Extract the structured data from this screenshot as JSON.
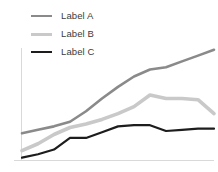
{
  "chart_data": {
    "type": "line",
    "title": "",
    "subtitle": "",
    "xlabel": "",
    "ylabel": "",
    "grid": false,
    "legend_position": "top-left",
    "xlim": [
      0,
      12
    ],
    "ylim": [
      0,
      100
    ],
    "x": [
      0,
      1,
      2,
      3,
      4,
      5,
      6,
      7,
      8,
      9,
      10,
      11,
      12
    ],
    "series": [
      {
        "name": "Label A",
        "color": "#8a8a8a",
        "width": 2.6,
        "values": [
          23,
          26,
          29,
          33,
          42,
          53,
          63,
          72,
          78,
          80,
          85,
          90,
          95
        ]
      },
      {
        "name": "Label B",
        "color": "#c9c9c9",
        "width": 3.6,
        "values": [
          8,
          14,
          22,
          28,
          31,
          35,
          40,
          46,
          56,
          53,
          53,
          52,
          40
        ]
      },
      {
        "name": "Label C",
        "color": "#1d1d1d",
        "width": 2.2,
        "values": [
          2,
          5,
          9,
          19,
          19,
          24,
          29,
          30,
          30,
          25,
          26,
          27,
          27
        ]
      }
    ],
    "axis": {
      "color": "#d9d9d9",
      "x_axis_visible": true,
      "y_axis_visible": true,
      "tick_labels_x": [],
      "tick_labels_y": []
    }
  },
  "legend": {
    "items": [
      {
        "label": "Label A",
        "swatch": "line-swatch-a"
      },
      {
        "label": "Label B",
        "swatch": "line-swatch-b"
      },
      {
        "label": "Label C",
        "swatch": "line-swatch-c"
      }
    ]
  }
}
